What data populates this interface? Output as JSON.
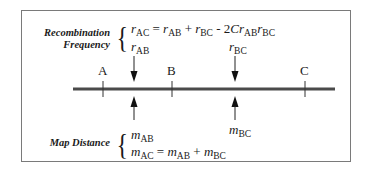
{
  "diagram": {
    "recombination": {
      "label_line1": "Recombination",
      "label_line2": "Frequency",
      "formula": {
        "lhs_var": "r",
        "lhs_sub": "AC",
        "eq": "=",
        "t1_var": "r",
        "t1_sub": "AB",
        "plus": "+",
        "t2_var": "r",
        "t2_sub": "BC",
        "minus": "- 2",
        "c": "C",
        "t3_var": "r",
        "t3_sub": "AB",
        "t4_var": "r",
        "t4_sub": "BC"
      },
      "interval_ab": {
        "var": "r",
        "sub": "AB"
      },
      "interval_bc": {
        "var": "r",
        "sub": "BC"
      }
    },
    "map_distance": {
      "label": "Map Distance",
      "interval_ab": {
        "var": "m",
        "sub": "AB"
      },
      "interval_bc": {
        "var": "m",
        "sub": "BC"
      },
      "formula": {
        "lhs_var": "m",
        "lhs_sub": "AC",
        "eq": "=",
        "t1_var": "m",
        "t1_sub": "AB",
        "plus": "+",
        "t2_var": "m",
        "t2_sub": "BC"
      }
    },
    "loci": [
      {
        "name": "A",
        "x": 103
      },
      {
        "name": "B",
        "x": 172
      },
      {
        "name": "C",
        "x": 305
      }
    ],
    "chromosome": {
      "x1": 73,
      "x2": 335,
      "y": 89,
      "color": "#4a4a4a"
    }
  }
}
